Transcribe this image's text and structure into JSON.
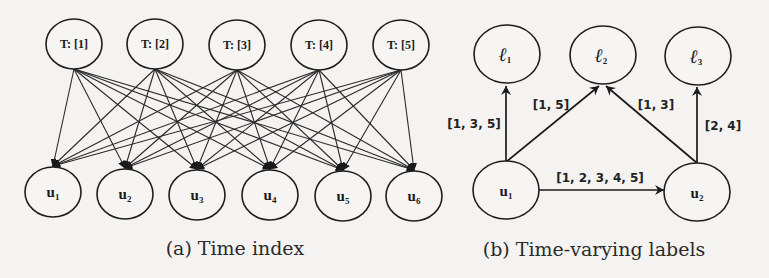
{
  "diagram_a": {
    "caption": "(a) Time index",
    "top_nodes": [
      {
        "id": "t1",
        "label": "T: [1]",
        "cx": 74,
        "cy": 44
      },
      {
        "id": "t2",
        "label": "T: [2]",
        "cx": 155,
        "cy": 44
      },
      {
        "id": "t3",
        "label": "T: [3]",
        "cx": 237,
        "cy": 45
      },
      {
        "id": "t4",
        "label": "T: [4]",
        "cx": 319,
        "cy": 45
      },
      {
        "id": "t5",
        "label": "T: [5]",
        "cx": 401,
        "cy": 45
      }
    ],
    "bottom_nodes": [
      {
        "id": "u1",
        "base": "u",
        "sub": "1",
        "cx": 53,
        "cy": 192
      },
      {
        "id": "u2",
        "base": "u",
        "sub": "2",
        "cx": 125,
        "cy": 194
      },
      {
        "id": "u3",
        "base": "u",
        "sub": "3",
        "cx": 197,
        "cy": 195
      },
      {
        "id": "u4",
        "base": "u",
        "sub": "4",
        "cx": 270,
        "cy": 195
      },
      {
        "id": "u5",
        "base": "u",
        "sub": "5",
        "cx": 343,
        "cy": 196
      },
      {
        "id": "u6",
        "base": "u",
        "sub": "6",
        "cx": 414,
        "cy": 196
      }
    ],
    "edges": "complete-bipartite: every T node -> every u node"
  },
  "diagram_b": {
    "caption": "(b) Time-varying labels",
    "label_nodes": [
      {
        "id": "l1",
        "base": "ℓ",
        "sub": "1",
        "cx": 507,
        "cy": 54
      },
      {
        "id": "l2",
        "base": "ℓ",
        "sub": "2",
        "cx": 603,
        "cy": 55
      },
      {
        "id": "l3",
        "base": "ℓ",
        "sub": "3",
        "cx": 698,
        "cy": 56
      }
    ],
    "user_nodes": [
      {
        "id": "u1",
        "base": "u",
        "sub": "1",
        "cx": 506,
        "cy": 190
      },
      {
        "id": "u2",
        "base": "u",
        "sub": "2",
        "cx": 697,
        "cy": 192
      }
    ],
    "edges": [
      {
        "from": "u1",
        "to": "l1",
        "label": "[1, 3, 5]"
      },
      {
        "from": "u1",
        "to": "l2",
        "label": "[1, 5]"
      },
      {
        "from": "u2",
        "to": "l2",
        "label": "[1, 3]"
      },
      {
        "from": "u2",
        "to": "l3",
        "label": "[2, 4]"
      },
      {
        "from": "u1",
        "to": "u2",
        "label": "[1, 2, 3, 4, 5]"
      }
    ]
  }
}
